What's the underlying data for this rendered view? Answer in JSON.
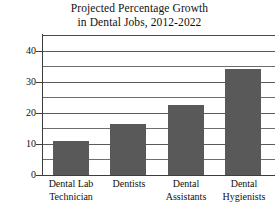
{
  "chart_data": {
    "type": "bar",
    "title": "Projected Percentage Growth in Dental Jobs, 2012-2022",
    "title_lines": [
      "Projected Percentage Growth",
      "in Dental Jobs, 2012-2022"
    ],
    "categories": [
      "Dental Lab Technician",
      "Dentists",
      "Dental Assistants",
      "Dental Hygienists"
    ],
    "category_lines": [
      [
        "Dental Lab",
        "Technician"
      ],
      [
        "Dentists",
        ""
      ],
      [
        "Dental",
        "Assistants"
      ],
      [
        "Dental",
        "Hygienists"
      ]
    ],
    "values": [
      11,
      16.5,
      22.5,
      34
    ],
    "xlabel": "",
    "ylabel": "",
    "ylim": [
      0,
      45
    ],
    "ytick_labels": [
      "0",
      "10",
      "20",
      "30",
      "40"
    ],
    "ytick_values": [
      0,
      10,
      20,
      30,
      40
    ],
    "minor_tick_values": [
      5,
      15,
      25,
      35,
      45
    ],
    "grid": "horizontal",
    "legend": "none",
    "bar_color": "#595959",
    "axis_color": "#3d3d3d",
    "grid_color": "#6d6d6d",
    "background": "#ffffff"
  }
}
